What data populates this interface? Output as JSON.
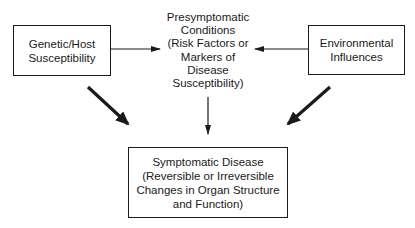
{
  "diagram": {
    "nodes": {
      "genetic": {
        "lines": [
          "Genetic/Host",
          "Susceptibility"
        ]
      },
      "presymptomatic": {
        "lines": [
          "Presymptomatic",
          "Conditions",
          "(Risk Factors or",
          "Markers of",
          "Disease",
          "Susceptibility)"
        ]
      },
      "environmental": {
        "lines": [
          "Environmental",
          "Influences"
        ]
      },
      "symptomatic": {
        "lines": [
          "Symptomatic Disease",
          "(Reversible or Irreversible",
          "Changes in Organ Structure",
          "and Function)"
        ]
      }
    },
    "edges": [
      {
        "from": "genetic",
        "to": "presymptomatic",
        "style": "thin"
      },
      {
        "from": "environmental",
        "to": "presymptomatic",
        "style": "thin"
      },
      {
        "from": "presymptomatic",
        "to": "symptomatic",
        "style": "thin"
      },
      {
        "from": "genetic",
        "to": "symptomatic",
        "style": "thick"
      },
      {
        "from": "environmental",
        "to": "symptomatic",
        "style": "thick"
      }
    ],
    "colors": {
      "line": "#1a1a1a",
      "background": "#ffffff"
    }
  }
}
